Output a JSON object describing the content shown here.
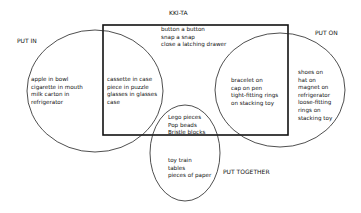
{
  "title": "KKI-TA",
  "categories": {
    "put_in": "PUT IN",
    "put_on": "PUT ON",
    "put_together": "PUT TOGETHER"
  },
  "regions": {
    "put_in_only": [
      "apple in bowl",
      "cigarette in mouth",
      "milk carton in",
      "refrigerator"
    ],
    "box_and_put_in": [
      "cassette in case",
      "piece in puzzle",
      "glasses in glasses",
      "case"
    ],
    "box_only": [
      "button a button",
      "snap a snap",
      "close a latching drawer"
    ],
    "box_and_put_on": [
      "bracelet on",
      "cap on pen",
      "tight-fitting rings",
      "on stacking toy"
    ],
    "put_on_only": [
      "shoes on",
      "hat on",
      "magnet on",
      "refrigerator",
      "loose-fitting",
      "rings on",
      "stacking toy"
    ],
    "box_and_put_together": [
      "Lego pieces",
      "Pop beads",
      "Bristle blocks"
    ],
    "put_together_only": [
      "toy train",
      "tables",
      "pieces of paper"
    ]
  }
}
